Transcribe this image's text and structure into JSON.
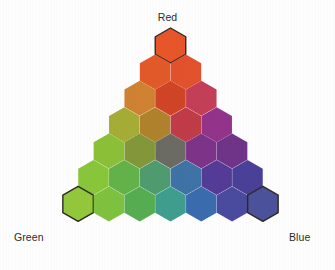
{
  "figure": {
    "title_visible": false,
    "background_color": "#fefefe",
    "label_color": "#2b2b2b"
  },
  "labels": {
    "red": "Red",
    "green": "Green",
    "blue": "Blue"
  },
  "chart_data": {
    "type": "heatmap",
    "subtitle": "",
    "xlabel": "",
    "ylabel": "",
    "legend_position": "corners",
    "grid": false,
    "vertices": [
      {
        "name": "Red",
        "position": "top",
        "label": "Red"
      },
      {
        "name": "Green",
        "position": "bottom-left",
        "label": "Green"
      },
      {
        "name": "Blue",
        "position": "bottom-right",
        "label": "Blue"
      }
    ],
    "rows": 7,
    "cell_count": 28,
    "geometry": {
      "orientation": "pointy-top",
      "hex_width": 30.5,
      "hex_height": 35.0,
      "col_pitch": 30.8,
      "row_pitch": 26.4,
      "apex_center_x": 170.5,
      "apex_center_y": 45.5,
      "gap_color": "#fdfdfd",
      "outline_color": "#2e2a22",
      "outline_width": 1.4
    },
    "axis_note": "Row index r = 0 at apex (pure red end) to r = 6 at base; within a row, column index c = 0 at the left (green side) to c = r at the right (blue side).",
    "cells": [
      {
        "row": 0,
        "col": 0,
        "color": "#e8562a",
        "red": 6,
        "green": 0,
        "blue": 0,
        "outlined": true
      },
      {
        "row": 1,
        "col": 0,
        "color": "#e35a28",
        "red": 5,
        "green": 1,
        "blue": 0,
        "outlined": false
      },
      {
        "row": 1,
        "col": 1,
        "color": "#e2522c",
        "red": 5,
        "green": 0,
        "blue": 1,
        "outlined": false
      },
      {
        "row": 2,
        "col": 0,
        "color": "#d08233",
        "red": 4,
        "green": 2,
        "blue": 0,
        "outlined": false
      },
      {
        "row": 2,
        "col": 1,
        "color": "#d14526",
        "red": 4,
        "green": 1,
        "blue": 1,
        "outlined": false
      },
      {
        "row": 2,
        "col": 2,
        "color": "#c33f57",
        "red": 4,
        "green": 0,
        "blue": 2,
        "outlined": false
      },
      {
        "row": 3,
        "col": 0,
        "color": "#a5ad36",
        "red": 3,
        "green": 3,
        "blue": 0,
        "outlined": false
      },
      {
        "row": 3,
        "col": 1,
        "color": "#b0822c",
        "red": 3,
        "green": 2,
        "blue": 1,
        "outlined": false
      },
      {
        "row": 3,
        "col": 2,
        "color": "#c03c48",
        "red": 3,
        "green": 1,
        "blue": 2,
        "outlined": false
      },
      {
        "row": 3,
        "col": 3,
        "color": "#93348a",
        "red": 3,
        "green": 0,
        "blue": 3,
        "outlined": false
      },
      {
        "row": 4,
        "col": 0,
        "color": "#8cc038",
        "red": 2,
        "green": 4,
        "blue": 0,
        "outlined": false
      },
      {
        "row": 4,
        "col": 1,
        "color": "#83973a",
        "red": 2,
        "green": 3,
        "blue": 1,
        "outlined": false
      },
      {
        "row": 4,
        "col": 2,
        "color": "#6b6b63",
        "red": 2,
        "green": 2,
        "blue": 2,
        "outlined": false
      },
      {
        "row": 4,
        "col": 3,
        "color": "#7d3389",
        "red": 2,
        "green": 1,
        "blue": 3,
        "outlined": false
      },
      {
        "row": 4,
        "col": 4,
        "color": "#6f3489",
        "red": 2,
        "green": 0,
        "blue": 4,
        "outlined": false
      },
      {
        "row": 5,
        "col": 0,
        "color": "#89c63a",
        "red": 1,
        "green": 5,
        "blue": 0,
        "outlined": false
      },
      {
        "row": 5,
        "col": 1,
        "color": "#63b24a",
        "red": 1,
        "green": 4,
        "blue": 1,
        "outlined": false
      },
      {
        "row": 5,
        "col": 2,
        "color": "#4f9c6f",
        "red": 1,
        "green": 3,
        "blue": 2,
        "outlined": false
      },
      {
        "row": 5,
        "col": 3,
        "color": "#3f72a6",
        "red": 1,
        "green": 2,
        "blue": 3,
        "outlined": false
      },
      {
        "row": 5,
        "col": 4,
        "color": "#553b97",
        "red": 1,
        "green": 1,
        "blue": 4,
        "outlined": false
      },
      {
        "row": 5,
        "col": 5,
        "color": "#4a4098",
        "red": 1,
        "green": 0,
        "blue": 5,
        "outlined": false
      },
      {
        "row": 6,
        "col": 0,
        "color": "#93c83c",
        "red": 0,
        "green": 6,
        "blue": 0,
        "outlined": true
      },
      {
        "row": 6,
        "col": 1,
        "color": "#7ec23f",
        "red": 0,
        "green": 5,
        "blue": 1,
        "outlined": false
      },
      {
        "row": 6,
        "col": 2,
        "color": "#56ae51",
        "red": 0,
        "green": 4,
        "blue": 2,
        "outlined": false
      },
      {
        "row": 6,
        "col": 3,
        "color": "#3f9e8e",
        "red": 0,
        "green": 3,
        "blue": 3,
        "outlined": false
      },
      {
        "row": 6,
        "col": 4,
        "color": "#3a6cae",
        "red": 0,
        "green": 2,
        "blue": 4,
        "outlined": false
      },
      {
        "row": 6,
        "col": 5,
        "color": "#4a4b9e",
        "red": 0,
        "green": 1,
        "blue": 5,
        "outlined": false
      },
      {
        "row": 6,
        "col": 6,
        "color": "#4c529b",
        "red": 0,
        "green": 0,
        "blue": 6,
        "outlined": true
      }
    ]
  }
}
